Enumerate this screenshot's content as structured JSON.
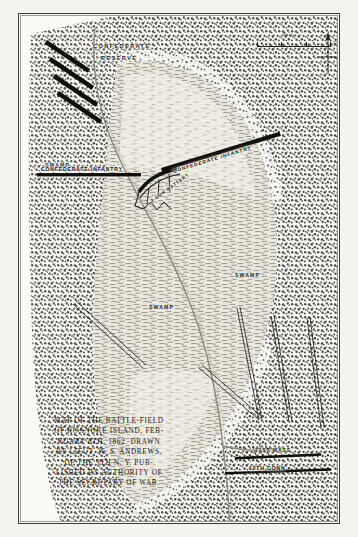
{
  "document": {
    "kind": "engraved-map-plate",
    "title": "Map of the Battle-Field of Roanoke Island"
  },
  "scale": {
    "title": "Scale",
    "ticks": [
      "100",
      "200",
      "300"
    ],
    "unit": "FEET"
  },
  "compass": {
    "icon": "north-arrow-icon"
  },
  "map_labels": {
    "confederate_reserve_line1": "CONFEDERATE",
    "confederate_reserve_line2": "RESERVE",
    "confederate_infantry_left": "CONFEDERATE INFANTRY",
    "confederate_infantry_right": "CONFEDERATE INFANTRY",
    "battery": "3 GUN BATTERY",
    "swamp_upper_left": "SWAMP",
    "swamp_center": "SWAMP",
    "swamp_right": "SWAMP",
    "union_21st_mass": "21ST MASS",
    "union_10th_conn": "10TH CONN"
  },
  "caption": {
    "lines": [
      "MAP OF THE BATTLE-FIELD",
      "OF ROANOKE ISLAND, FEB-",
      "RUARY 8TH, 1862.  DRAWN",
      "BY LIEUT. W. S. ANDREWS,",
      "OF THE 9TH N. Y.   PUB-",
      "LISHED BY AUTHORITY OF",
      "THE SECRETARY OF WAR."
    ]
  },
  "colors": {
    "paper": "#fbfaf7",
    "ink": "#1a1a16",
    "forest": "#55534a",
    "clearing": "#d8d6cd",
    "road": "#8d8a7e",
    "troop_bar": "#100f0b"
  }
}
